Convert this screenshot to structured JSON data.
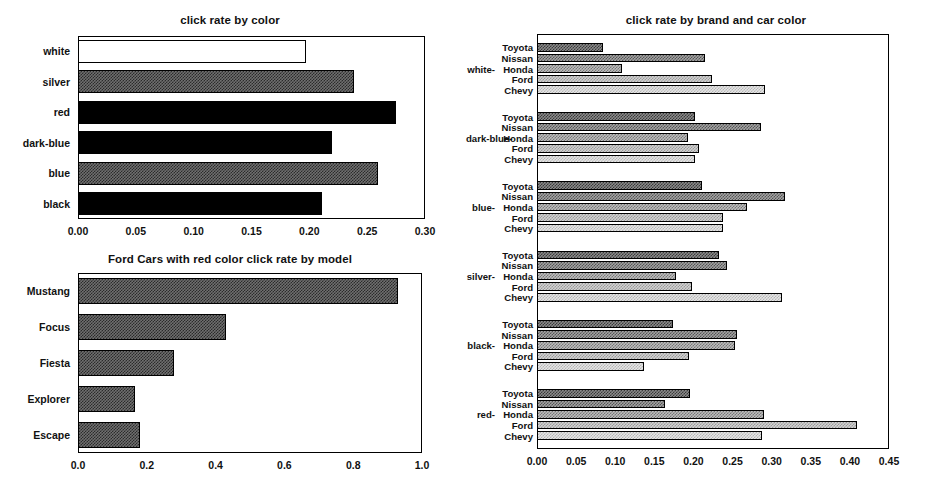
{
  "chart_data": [
    {
      "id": "click-rate-by-color",
      "type": "bar",
      "orientation": "horizontal",
      "title": "click rate by color",
      "xlabel": "",
      "ylabel": "",
      "xlim": [
        0.0,
        0.3
      ],
      "xticks": [
        "0.00",
        "0.05",
        "0.10",
        "0.15",
        "0.20",
        "0.25",
        "0.30"
      ],
      "xtick_values": [
        0.0,
        0.05,
        0.1,
        0.15,
        0.2,
        0.25,
        0.3
      ],
      "grid": false,
      "legend": "none",
      "categories": [
        "black",
        "blue",
        "dark-blue",
        "red",
        "silver",
        "white"
      ],
      "values": [
        0.211,
        0.259,
        0.22,
        0.275,
        0.239,
        0.197
      ],
      "bar_fills": [
        "black",
        "gray",
        "black",
        "black",
        "gray",
        "white"
      ]
    },
    {
      "id": "ford-red-by-model",
      "type": "bar",
      "orientation": "horizontal",
      "title": "Ford Cars with red color click rate by model",
      "xlabel": "",
      "ylabel": "",
      "xlim": [
        0.0,
        1.0
      ],
      "xticks": [
        "0.0",
        "0.2",
        "0.4",
        "0.6",
        "0.8",
        "1.0"
      ],
      "xtick_values": [
        0.0,
        0.2,
        0.4,
        0.6,
        0.8,
        1.0
      ],
      "grid": false,
      "legend": "none",
      "categories": [
        "Escape",
        "Explorer",
        "Fiesta",
        "Focus",
        "Mustang"
      ],
      "values": [
        0.18,
        0.165,
        0.28,
        0.43,
        0.93
      ],
      "bar_fills": [
        "gray",
        "gray",
        "gray",
        "gray",
        "gray"
      ]
    },
    {
      "id": "click-rate-by-brand-and-car-color",
      "type": "bar",
      "orientation": "horizontal",
      "title": "click rate by brand and car color",
      "xlabel": "",
      "ylabel": "",
      "xlim": [
        0.0,
        0.45
      ],
      "xticks": [
        "0.00",
        "0.05",
        "0.10",
        "0.15",
        "0.20",
        "0.25",
        "0.30",
        "0.35",
        "0.40",
        "0.45"
      ],
      "xtick_values": [
        0.0,
        0.05,
        0.1,
        0.15,
        0.2,
        0.25,
        0.3,
        0.35,
        0.4,
        0.45
      ],
      "grid": false,
      "legend": "none",
      "brands": [
        "Toyota",
        "Nissan",
        "Honda",
        "Ford",
        "Chevy"
      ],
      "groups": [
        {
          "label": "red",
          "values": [
            0.196,
            0.164,
            0.29,
            0.409,
            0.288
          ]
        },
        {
          "label": "black",
          "values": [
            0.174,
            0.256,
            0.253,
            0.194,
            0.137
          ]
        },
        {
          "label": "silver",
          "values": [
            0.233,
            0.243,
            0.178,
            0.198,
            0.313
          ]
        },
        {
          "label": "blue",
          "values": [
            0.211,
            0.317,
            0.268,
            0.238,
            0.238
          ]
        },
        {
          "label": "dark-blue",
          "values": [
            0.202,
            0.286,
            0.193,
            0.207,
            0.202
          ]
        },
        {
          "label": "white",
          "values": [
            0.084,
            0.215,
            0.109,
            0.224,
            0.292
          ]
        }
      ]
    }
  ]
}
